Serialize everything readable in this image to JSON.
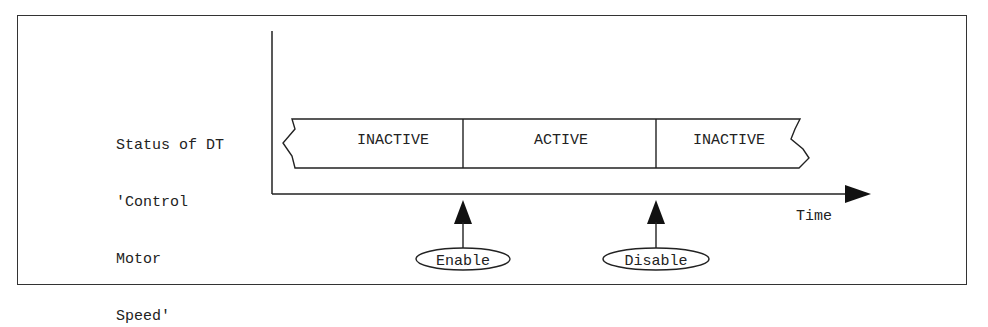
{
  "diagram": {
    "y_axis_label_lines": [
      "Status of DT",
      "'Control",
      "Motor",
      "Speed'"
    ],
    "x_axis_label": "Time",
    "states": [
      {
        "label": "INACTIVE",
        "x_start": 283,
        "x_end": 463
      },
      {
        "label": "ACTIVE",
        "x_start": 463,
        "x_end": 656
      },
      {
        "label": "INACTIVE",
        "x_start": 656,
        "x_end": 808
      }
    ],
    "events": [
      {
        "label": "Enable",
        "x": 463
      },
      {
        "label": "Disable",
        "x": 656
      }
    ],
    "colors": {
      "line": "#222222",
      "background": "#ffffff"
    }
  }
}
